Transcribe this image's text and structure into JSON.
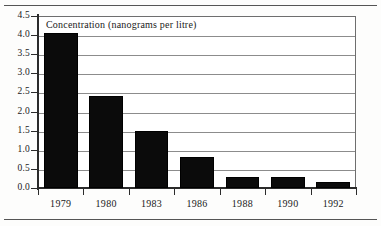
{
  "chart_data": {
    "type": "bar",
    "title": "Concentration (nanograms per litre)",
    "xlabel": "",
    "ylabel": "",
    "categories": [
      "1979",
      "1980",
      "1983",
      "1986",
      "1988",
      "1990",
      "1992"
    ],
    "values": [
      4.05,
      2.4,
      1.5,
      0.8,
      0.3,
      0.3,
      0.15
    ],
    "ylim": [
      0.0,
      4.5
    ],
    "yticks": [
      0.0,
      0.5,
      1.0,
      1.5,
      2.0,
      2.5,
      3.0,
      3.5,
      4.0,
      4.5
    ],
    "ytick_labels": [
      "0.0",
      "0.5",
      "1.0",
      "1.5",
      "2.0",
      "2.5",
      "3.0",
      "3.5",
      "4.0",
      "4.5"
    ],
    "grid": "horizontal",
    "legend": "none",
    "bar_color": "#0b0b0b",
    "gridline_color": "#8c8c8c",
    "axis_color": "#2b2b2b",
    "background_color": "#ffffff"
  }
}
